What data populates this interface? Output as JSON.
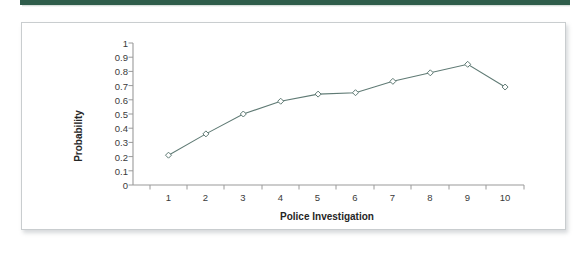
{
  "decor": {
    "top_rule_color": "#2f5d4b",
    "card_border_color": "#c9cdcf",
    "card_background": "#ffffff"
  },
  "chart_data": {
    "type": "line",
    "title": "",
    "subtitle": "",
    "xlabel": "Police Investigation",
    "ylabel": "Probability",
    "categories": [
      "1",
      "2",
      "3",
      "4",
      "5",
      "6",
      "7",
      "8",
      "9",
      "10"
    ],
    "x": [
      1,
      2,
      3,
      4,
      5,
      6,
      7,
      8,
      9,
      10
    ],
    "values": [
      0.21,
      0.36,
      0.5,
      0.59,
      0.64,
      0.65,
      0.73,
      0.79,
      0.85,
      0.69
    ],
    "series": [
      {
        "name": "Probability",
        "values": [
          0.21,
          0.36,
          0.5,
          0.59,
          0.64,
          0.65,
          0.73,
          0.79,
          0.85,
          0.69
        ],
        "color": "#5f7a74",
        "marker": "diamond"
      }
    ],
    "xlim": [
      0.5,
      10.5
    ],
    "ylim": [
      0,
      1
    ],
    "yticks": [
      0,
      0.1,
      0.2,
      0.3,
      0.4,
      0.5,
      0.6,
      0.7,
      0.8,
      0.9,
      1
    ],
    "ytick_labels": [
      "0",
      "0.1",
      "0.2",
      "0.3",
      "0.4",
      "0.5",
      "0.6",
      "0.7",
      "0.8",
      "0.9",
      "1"
    ],
    "xtick_labels": [
      "1",
      "2",
      "3",
      "4",
      "5",
      "6",
      "7",
      "8",
      "9",
      "10"
    ],
    "grid": false,
    "legend": false,
    "legend_position": "none",
    "annotations": []
  }
}
